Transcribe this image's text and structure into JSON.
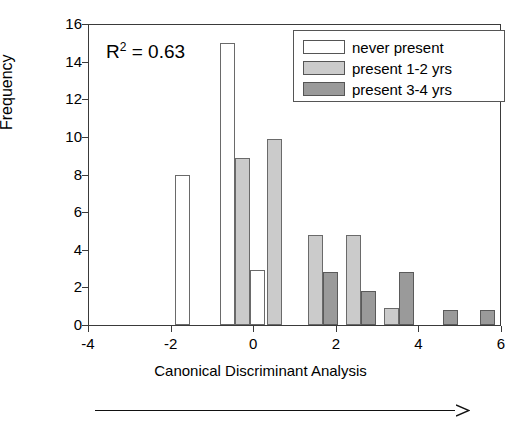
{
  "chart_data": {
    "type": "bar",
    "title": "",
    "xlabel": "Canonical Discriminant Analysis",
    "ylabel": "Frequency",
    "xlim": [
      -4,
      6
    ],
    "ylim": [
      0,
      16
    ],
    "xticks": [
      -4,
      -2,
      0,
      2,
      4,
      6
    ],
    "yticks": [
      0,
      2,
      4,
      6,
      8,
      10,
      12,
      14,
      16
    ],
    "grid": false,
    "legend_position": "top-right",
    "annotation": "R2 = 0.63",
    "annotation_r": "R",
    "annotation_sup": "2",
    "annotation_rest": " = 0.63",
    "series": [
      {
        "name": "never present",
        "color": "#ffffff",
        "points": [
          {
            "x": -1.72,
            "y": 8.0
          },
          {
            "x": -0.62,
            "y": 15.0
          },
          {
            "x": 0.1,
            "y": 2.9
          }
        ]
      },
      {
        "name": "present 1-2 yrs",
        "color": "#cbcbcb",
        "points": [
          {
            "x": -0.25,
            "y": 8.9
          },
          {
            "x": 0.52,
            "y": 9.9
          },
          {
            "x": 1.52,
            "y": 4.8
          },
          {
            "x": 2.42,
            "y": 4.8
          },
          {
            "x": 3.35,
            "y": 0.9
          }
        ]
      },
      {
        "name": "present 3-4 yrs",
        "color": "#9a9a9a",
        "points": [
          {
            "x": 1.88,
            "y": 2.8
          },
          {
            "x": 2.78,
            "y": 1.8
          },
          {
            "x": 3.72,
            "y": 2.8
          },
          {
            "x": 4.78,
            "y": 0.8
          },
          {
            "x": 5.68,
            "y": 0.8
          }
        ]
      }
    ]
  },
  "legend": {
    "items": [
      {
        "label": "never present",
        "swatch": "never"
      },
      {
        "label": "present 1-2 yrs",
        "swatch": "y12"
      },
      {
        "label": "present 3-4 yrs",
        "swatch": "y34"
      }
    ]
  },
  "arrow": {
    "name": "direction-arrow"
  }
}
